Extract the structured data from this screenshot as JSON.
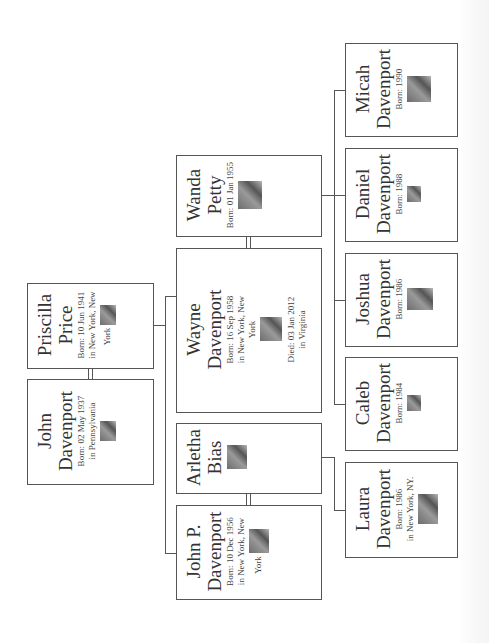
{
  "chart": {
    "orientation": "rotated-90-ccw",
    "generations": [
      {
        "level": 1,
        "people": [
          {
            "id": "priscilla",
            "first": "Priscilla",
            "last": "Price",
            "born": "Born: 10 Jun 1941",
            "born_place": "in New York, New",
            "born_place2": "York",
            "photo": "portrait-photo"
          },
          {
            "id": "john",
            "first": "John",
            "last": "Davenport",
            "born": "Born: 02 May 1937",
            "born_place": "in Pennsylvania",
            "photo": "portrait-photo"
          }
        ]
      },
      {
        "level": 2,
        "people": [
          {
            "id": "wanda",
            "first": "Wanda",
            "last": "Petty",
            "born": "Born: 01 Jan 1955",
            "photo": "portrait-photo"
          },
          {
            "id": "wayne",
            "first": "Wayne",
            "last": "Davenport",
            "born": "Born: 16 Sep 1958",
            "born_place": "in New York, New",
            "born_place2": "York",
            "died": "Died: 03 Jan 2012",
            "died_place": "in Virginia",
            "photo": "portrait-photo"
          },
          {
            "id": "arletha",
            "first": "Arletha",
            "last": "Bias",
            "photo": "portrait-photo"
          },
          {
            "id": "johnp",
            "first": "John P.",
            "last": "Davenport",
            "born": "Born: 10 Dec 1956",
            "born_place": "in New York, New",
            "born_place2": "York",
            "photo": "portrait-photo"
          }
        ]
      },
      {
        "level": 3,
        "people": [
          {
            "id": "micah",
            "first": "Micah",
            "last": "Davenport",
            "born": "Born: 1990",
            "photo": "portrait-photo"
          },
          {
            "id": "daniel",
            "first": "Daniel",
            "last": "Davenport",
            "born": "Born: 1988",
            "photo": "portrait-photo"
          },
          {
            "id": "joshua",
            "first": "Joshua",
            "last": "Davenport",
            "born": "Born: 1986",
            "photo": "portrait-photo"
          },
          {
            "id": "caleb",
            "first": "Caleb",
            "last": "Davenport",
            "born": "Born: 1984",
            "photo": "portrait-photo"
          },
          {
            "id": "laura",
            "first": "Laura",
            "last": "Davenport",
            "born": "Born: 1986",
            "born_place": "in New York, NY.",
            "photo": "portrait-photo"
          }
        ]
      }
    ]
  },
  "colors": {
    "border": "#555555",
    "text": "#333333",
    "background": "#ffffff"
  }
}
